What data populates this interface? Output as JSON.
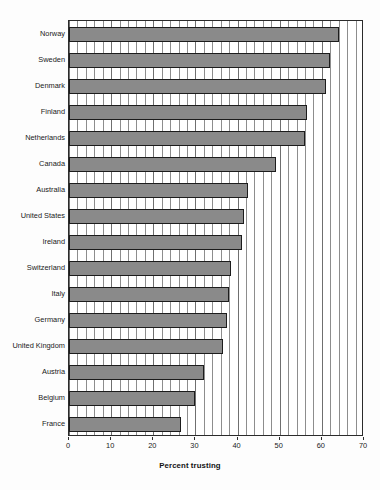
{
  "chart_data": {
    "type": "bar",
    "orientation": "horizontal",
    "title": "",
    "xlabel": "Percent trusting",
    "ylabel": "",
    "xlim": [
      0,
      70
    ],
    "ylim": null,
    "grid": "vertical-minor-and-major",
    "xticks": [
      0,
      10,
      20,
      30,
      40,
      50,
      60,
      70
    ],
    "xtick_labels": [
      "0",
      "10",
      "20",
      "30",
      "40",
      "50",
      "60",
      "70"
    ],
    "minor_tick_step": 2,
    "legend": null,
    "bar_color": "#8a8a8a",
    "bar_edge_color": "#1c1c1c",
    "categories": [
      "Norway",
      "Sweden",
      "Denmark",
      "Finland",
      "Netherlands",
      "Canada",
      "Australia",
      "United States",
      "Ireland",
      "Switzerland",
      "Italy",
      "Germany",
      "United Kingdom",
      "Austria",
      "Belgium",
      "France"
    ],
    "values": [
      64,
      62,
      61,
      56.5,
      56,
      49,
      42.5,
      41.5,
      41,
      38.5,
      38,
      37.5,
      36.5,
      32,
      30,
      26.5
    ]
  }
}
